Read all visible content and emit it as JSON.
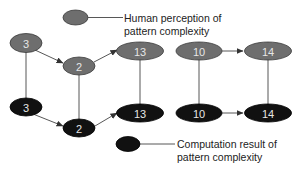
{
  "colors": {
    "human_fill": "#6e6e6e",
    "human_stroke": "#3a3a3a",
    "computation_fill": "#111111",
    "computation_stroke": "#000000",
    "edge": "#444444",
    "label": "#e6e6e6",
    "background": "#ffffff"
  },
  "legend": {
    "human": {
      "line1": "Human perception of",
      "line2": "pattern complexity"
    },
    "computation": {
      "line1": "Computation result of",
      "line2": "pattern complexity"
    }
  },
  "nodes": {
    "human": [
      {
        "id": "h3",
        "label": "3"
      },
      {
        "id": "h2",
        "label": "2"
      },
      {
        "id": "h13",
        "label": "13"
      },
      {
        "id": "h10",
        "label": "10"
      },
      {
        "id": "h14",
        "label": "14"
      }
    ],
    "computation": [
      {
        "id": "c3",
        "label": "3"
      },
      {
        "id": "c2",
        "label": "2"
      },
      {
        "id": "c13",
        "label": "13"
      },
      {
        "id": "c10",
        "label": "10"
      },
      {
        "id": "c14",
        "label": "14"
      }
    ]
  },
  "edges": [
    {
      "from": "h3",
      "to": "h2",
      "type": "arrow"
    },
    {
      "from": "h2",
      "to": "h13",
      "type": "arrow"
    },
    {
      "from": "h10",
      "to": "h14",
      "type": "arrow"
    },
    {
      "from": "c3",
      "to": "c2",
      "type": "arrow"
    },
    {
      "from": "c2",
      "to": "c13",
      "type": "arrow"
    },
    {
      "from": "c10",
      "to": "c14",
      "type": "arrow"
    },
    {
      "from": "h3",
      "to": "c3",
      "type": "line"
    },
    {
      "from": "h2",
      "to": "c2",
      "type": "line"
    },
    {
      "from": "h13",
      "to": "c13",
      "type": "line"
    },
    {
      "from": "h10",
      "to": "c10",
      "type": "line"
    },
    {
      "from": "h14",
      "to": "c14",
      "type": "line"
    }
  ]
}
